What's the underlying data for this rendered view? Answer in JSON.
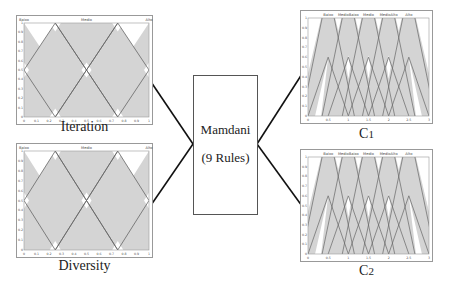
{
  "center": {
    "title": "Mamdani",
    "subtitle": "(9 Rules)"
  },
  "labels": {
    "input1": "Iteration",
    "input2": "Diversity",
    "output1": "C",
    "output1_sub": "1",
    "output2": "C",
    "output2_sub": "2"
  },
  "chart_data": [
    {
      "type": "line",
      "title": "Iteration",
      "xlabel": "Iteration",
      "ylabel": "",
      "xlim": [
        0,
        1
      ],
      "ylim": [
        0,
        1
      ],
      "xticks": [
        "0",
        "0.1",
        "0.2",
        "0.3",
        "0.4",
        "0.5",
        "0.6",
        "0.7",
        "0.8",
        "0.9",
        "1"
      ],
      "yticks": [
        "0",
        "0.1",
        "0.2",
        "0.3",
        "0.4",
        "0.5",
        "0.6",
        "0.7",
        "0.8",
        "0.9",
        "1"
      ],
      "legend": [
        "Baixo",
        "Medio",
        "Alto"
      ],
      "series": [
        {
          "name": "Baixo",
          "shape": "triangle",
          "params": [
            -0.5,
            0,
            0.5
          ]
        },
        {
          "name": "Medio",
          "shape": "triangle",
          "params": [
            0,
            0.5,
            1
          ]
        },
        {
          "name": "Alto",
          "shape": "triangle",
          "params": [
            0.5,
            1,
            1.5
          ]
        }
      ]
    },
    {
      "type": "line",
      "title": "Diversity",
      "xlabel": "Diversity",
      "xlim": [
        0,
        1
      ],
      "ylim": [
        0,
        1
      ],
      "xticks": [
        "0",
        "0.1",
        "0.2",
        "0.3",
        "0.4",
        "0.5",
        "0.6",
        "0.7",
        "0.8",
        "0.9",
        "1"
      ],
      "yticks": [
        "0",
        "0.1",
        "0.2",
        "0.3",
        "0.4",
        "0.5",
        "0.6",
        "0.7",
        "0.8",
        "0.9",
        "1"
      ],
      "legend": [
        "Baixo",
        "Medio",
        "Alto"
      ],
      "series": [
        {
          "name": "Baixo",
          "shape": "triangle",
          "params": [
            -0.5,
            0,
            0.5
          ]
        },
        {
          "name": "Medio",
          "shape": "triangle",
          "params": [
            0,
            0.5,
            1
          ]
        },
        {
          "name": "Alto",
          "shape": "triangle",
          "params": [
            0.5,
            1,
            1.5
          ]
        }
      ]
    },
    {
      "type": "line",
      "title": "C1",
      "xlabel": "C1",
      "xlim": [
        0,
        3
      ],
      "ylim": [
        0,
        1
      ],
      "xticks": [
        "0",
        "0.5",
        "1",
        "1.5",
        "2",
        "2.5",
        "3"
      ],
      "yticks": [
        "0",
        "0.1",
        "0.2",
        "0.3",
        "0.4",
        "0.5",
        "0.6",
        "0.7",
        "0.8",
        "0.9",
        "1"
      ],
      "legend": [
        "Baixo",
        "MedioBaixo",
        "Medio",
        "MedioAlto",
        "Alto"
      ],
      "series": [
        {
          "name": "Baixo",
          "shape": "triangle",
          "params": [
            0,
            0.5,
            1
          ]
        },
        {
          "name": "MedioBaixo",
          "shape": "triangle",
          "params": [
            0.5,
            1,
            1.5
          ]
        },
        {
          "name": "Medio",
          "shape": "triangle",
          "params": [
            1,
            1.5,
            2
          ]
        },
        {
          "name": "MedioAlto",
          "shape": "triangle",
          "params": [
            1.5,
            2,
            2.5
          ]
        },
        {
          "name": "Alto",
          "shape": "triangle",
          "params": [
            2,
            2.5,
            3
          ]
        }
      ]
    },
    {
      "type": "line",
      "title": "C2",
      "xlabel": "C2",
      "xlim": [
        0,
        3
      ],
      "ylim": [
        0,
        1
      ],
      "xticks": [
        "0",
        "0.5",
        "1",
        "1.5",
        "2",
        "2.5",
        "3"
      ],
      "yticks": [
        "0",
        "0.1",
        "0.2",
        "0.3",
        "0.4",
        "0.5",
        "0.6",
        "0.7",
        "0.8",
        "0.9",
        "1"
      ],
      "legend": [
        "Baixo",
        "MedioBaixo",
        "Medio",
        "MedioAlto",
        "Alto"
      ],
      "series": [
        {
          "name": "Baixo",
          "shape": "triangle",
          "params": [
            0,
            0.5,
            1
          ]
        },
        {
          "name": "MedioBaixo",
          "shape": "triangle",
          "params": [
            0.5,
            1,
            1.5
          ]
        },
        {
          "name": "Medio",
          "shape": "triangle",
          "params": [
            1,
            1.5,
            2
          ]
        },
        {
          "name": "MedioAlto",
          "shape": "triangle",
          "params": [
            1.5,
            2,
            2.5
          ]
        },
        {
          "name": "Alto",
          "shape": "triangle",
          "params": [
            2,
            2.5,
            3
          ]
        }
      ]
    }
  ],
  "colors": {
    "plot_fill": "#d4d4d4",
    "line": "#666666",
    "frame": "#999999",
    "connector": "#111111"
  }
}
